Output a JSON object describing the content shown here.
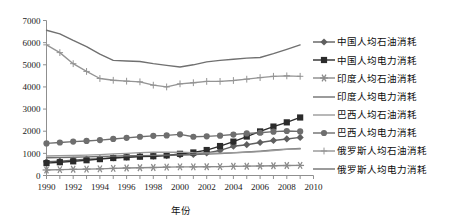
{
  "chart_data": {
    "type": "line",
    "title": "",
    "xlabel": "年份",
    "ylabel": "",
    "xlim": [
      1990,
      2010
    ],
    "ylim": [
      0,
      7000
    ],
    "grid": false,
    "legend_position": "right",
    "x": [
      1990,
      1991,
      1992,
      1993,
      1994,
      1995,
      1996,
      1997,
      1998,
      1999,
      2000,
      2001,
      2002,
      2003,
      2004,
      2005,
      2006,
      2007,
      2008,
      2009
    ],
    "x_tick_labels": [
      "1990",
      "1992",
      "1994",
      "1996",
      "1998",
      "2000",
      "2002",
      "2004",
      "2006",
      "2008",
      "2010"
    ],
    "x_ticks": [
      1990,
      1992,
      1994,
      1996,
      1998,
      2000,
      2002,
      2004,
      2006,
      2008,
      2010
    ],
    "y_tick_labels": [
      "0",
      "1000",
      "2000",
      "3000",
      "4000",
      "5000",
      "6000",
      "7000"
    ],
    "y_ticks": [
      0,
      1000,
      2000,
      3000,
      4000,
      5000,
      6000,
      7000
    ],
    "series": [
      {
        "name": "中国人均石油消耗",
        "marker": "diamond",
        "color": "#5f5f5f",
        "values": [
          620,
          650,
          690,
          740,
          760,
          800,
          830,
          870,
          870,
          900,
          930,
          950,
          1020,
          1130,
          1320,
          1390,
          1490,
          1580,
          1650,
          1720
        ]
      },
      {
        "name": "中国人均电力消耗",
        "marker": "square",
        "color": "#2b2b2b",
        "values": [
          560,
          600,
          640,
          690,
          740,
          790,
          820,
          850,
          870,
          910,
          980,
          1040,
          1150,
          1330,
          1530,
          1760,
          1990,
          2210,
          2400,
          2620
        ]
      },
      {
        "name": "印度人均石油消耗",
        "marker": "star",
        "color": "#8a8a8a",
        "values": [
          250,
          265,
          280,
          290,
          300,
          320,
          340,
          350,
          360,
          380,
          390,
          390,
          395,
          400,
          415,
          420,
          430,
          440,
          450,
          455
        ]
      },
      {
        "name": "印度人均电力消耗",
        "marker": "none",
        "color": "#707070",
        "values": [
          800,
          810,
          825,
          840,
          860,
          875,
          890,
          900,
          910,
          920,
          935,
          950,
          965,
          990,
          1020,
          1060,
          1100,
          1150,
          1190,
          1220
        ]
      },
      {
        "name": "巴西人均石油消耗",
        "marker": "none",
        "color": "#9a9a9a",
        "values": [
          880,
          890,
          905,
          920,
          945,
          975,
          1000,
          1030,
          1050,
          1050,
          1055,
          1030,
          1020,
          1010,
          1030,
          1050,
          1080,
          1130,
          1180,
          1200
        ]
      },
      {
        "name": "巴西人均电力消耗",
        "marker": "circle",
        "color": "#6e6e6e",
        "values": [
          1450,
          1490,
          1530,
          1560,
          1600,
          1650,
          1700,
          1750,
          1790,
          1810,
          1860,
          1750,
          1770,
          1800,
          1850,
          1900,
          1930,
          1980,
          2010,
          1990
        ]
      },
      {
        "name": "俄罗斯人均石油消耗",
        "marker": "plus",
        "color": "#949494",
        "values": [
          5900,
          5550,
          5050,
          4700,
          4380,
          4300,
          4260,
          4230,
          4080,
          4000,
          4140,
          4190,
          4250,
          4250,
          4290,
          4350,
          4420,
          4480,
          4500,
          4480
        ]
      },
      {
        "name": "俄罗斯人均电力消耗",
        "marker": "none",
        "color": "#707070",
        "values": [
          6560,
          6400,
          6100,
          5820,
          5480,
          5200,
          5170,
          5150,
          5050,
          4970,
          4900,
          5000,
          5130,
          5200,
          5250,
          5300,
          5330,
          5500,
          5700,
          5900
        ]
      }
    ]
  },
  "legend": {
    "items": [
      {
        "label": "中国人均石油消耗",
        "marker": "diamond",
        "color": "#5f5f5f"
      },
      {
        "label": "中国人均电力消耗",
        "marker": "square",
        "color": "#2b2b2b"
      },
      {
        "label": "印度人均石油消耗",
        "marker": "star",
        "color": "#8a8a8a"
      },
      {
        "label": "印度人均电力消耗",
        "marker": "none",
        "color": "#707070"
      },
      {
        "label": "巴西人均石油消耗",
        "marker": "none",
        "color": "#9a9a9a"
      },
      {
        "label": "巴西人均电力消耗",
        "marker": "circle",
        "color": "#6e6e6e"
      },
      {
        "label": "俄罗斯人均石油消耗",
        "marker": "plus",
        "color": "#949494"
      },
      {
        "label": "俄罗斯人均电力消耗",
        "marker": "none",
        "color": "#707070"
      }
    ]
  },
  "axes": {
    "x_axis_title": "年份",
    "frame_color": "#8f8f8f"
  }
}
